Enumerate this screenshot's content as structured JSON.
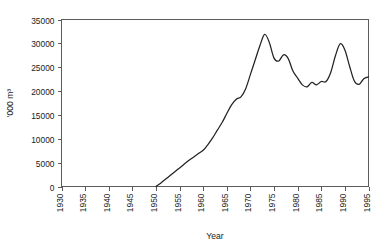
{
  "chart_data": {
    "type": "line",
    "title": "",
    "xlabel": "Year",
    "ylabel": "'000 m³",
    "xlim": [
      1930,
      1995
    ],
    "ylim": [
      0,
      35000
    ],
    "grid": false,
    "legend": false,
    "legend_position": "none",
    "xticks": [
      1930,
      1935,
      1940,
      1945,
      1950,
      1955,
      1960,
      1965,
      1970,
      1975,
      1980,
      1985,
      1990,
      1995
    ],
    "xtick_labels": [
      "1930",
      "1935",
      "1940",
      "1945",
      "1950",
      "1955",
      "1960",
      "1965",
      "1970",
      "1975",
      "1980",
      "1985",
      "1990",
      "1995"
    ],
    "yticks": [
      0,
      5000,
      10000,
      15000,
      20000,
      25000,
      30000,
      35000
    ],
    "ytick_labels": [
      "0",
      "5000",
      "10000",
      "15000",
      "20000",
      "25000",
      "30000",
      "35000"
    ],
    "series": [
      {
        "name": "Production",
        "color": "#222222",
        "x": [
          1950,
          1951,
          1952,
          1953,
          1954,
          1955,
          1956,
          1957,
          1958,
          1959,
          1960,
          1961,
          1962,
          1963,
          1964,
          1965,
          1966,
          1967,
          1968,
          1969,
          1970,
          1971,
          1972,
          1973,
          1974,
          1975,
          1976,
          1977,
          1978,
          1979,
          1980,
          1981,
          1982,
          1983,
          1984,
          1985,
          1986,
          1987,
          1988,
          1989,
          1990,
          1991,
          1992,
          1993,
          1994,
          1995
        ],
        "values": [
          0,
          700,
          1500,
          2300,
          3100,
          3900,
          4700,
          5500,
          6200,
          6900,
          7600,
          8800,
          10200,
          11800,
          13400,
          15300,
          17100,
          18300,
          18800,
          20500,
          23500,
          26500,
          29500,
          31900,
          30200,
          26900,
          26300,
          27600,
          26800,
          24200,
          22700,
          21300,
          20900,
          21800,
          21300,
          22000,
          22000,
          23900,
          27400,
          29900,
          28600,
          25200,
          22100,
          21400,
          22600,
          23000
        ]
      }
    ]
  },
  "axis": {
    "x_title": "Year",
    "y_title": "'000 m³"
  }
}
